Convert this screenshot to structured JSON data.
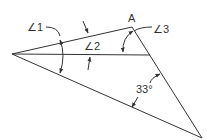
{
  "diagram": {
    "vertex_label": "A",
    "angles": [
      {
        "id": "angle-1",
        "label": "∠1"
      },
      {
        "id": "angle-2",
        "label": "∠2"
      },
      {
        "id": "angle-3",
        "label": "∠3"
      },
      {
        "id": "angle-given",
        "label": "33°"
      }
    ],
    "colors": {
      "stroke": "#333333",
      "background": "#ffffff"
    }
  }
}
